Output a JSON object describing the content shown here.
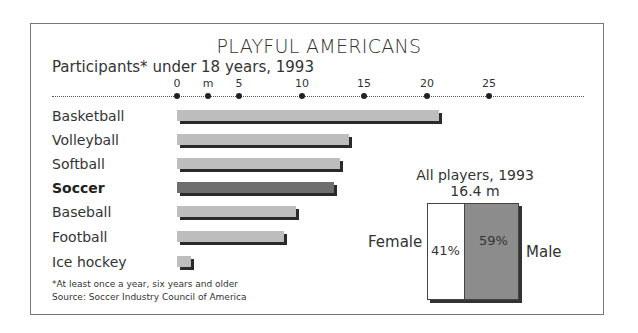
{
  "chart_data": [
    {
      "type": "bar",
      "orientation": "horizontal",
      "title": "PLAYFUL AMERICANS",
      "subtitle": "Participants* under 18 years, 1993",
      "xlabel": "m",
      "ylabel": "",
      "xlim": [
        0,
        25
      ],
      "x_ticks": [
        "0",
        "5",
        "10",
        "15",
        "20",
        "25"
      ],
      "unit_label": "m",
      "grid": false,
      "categories": [
        "Basketball",
        "Volleyball",
        "Softball",
        "Soccer",
        "Baseball",
        "Football",
        "Ice hockey"
      ],
      "values": [
        21.0,
        13.8,
        13.1,
        12.6,
        9.5,
        8.6,
        1.1
      ],
      "highlight": "Soccer",
      "colors": {
        "default": "#bdbdbd",
        "highlight": "#6e6e6e",
        "shadow": "#2a2a2a"
      }
    },
    {
      "type": "bar",
      "stacked": true,
      "title": "All players, 1993",
      "subtitle": "16.4 m",
      "categories": [
        "Female",
        "Male"
      ],
      "values": [
        41,
        59
      ],
      "value_labels": [
        "41%",
        "59%"
      ],
      "colors": {
        "Female": "#ffffff",
        "Male": "#8c8c8c"
      }
    }
  ],
  "header": {
    "title": "PLAYFUL AMERICANS",
    "subtitle": "Participants* under 18 years, 1993"
  },
  "axis": {
    "ticks": [
      {
        "label": "0",
        "x": 177
      },
      {
        "label": "5",
        "x": 239
      },
      {
        "label": "10",
        "x": 302
      },
      {
        "label": "15",
        "x": 364
      },
      {
        "label": "20",
        "x": 427
      },
      {
        "label": "25",
        "x": 489
      }
    ],
    "unit": {
      "label": "m",
      "x": 208
    }
  },
  "bars": [
    {
      "label": "Basketball",
      "value": 21.0,
      "top": 110
    },
    {
      "label": "Volleyball",
      "value": 13.8,
      "top": 134
    },
    {
      "label": "Softball",
      "value": 13.1,
      "top": 158
    },
    {
      "label": "Soccer",
      "value": 12.6,
      "top": 182
    },
    {
      "label": "Baseball",
      "value": 9.5,
      "top": 206
    },
    {
      "label": "Football",
      "value": 8.6,
      "top": 231
    },
    {
      "label": "Ice hockey",
      "value": 1.1,
      "top": 256
    }
  ],
  "inset": {
    "title": "All players, 1993",
    "total": "16.4 m",
    "female_label": "Female",
    "male_label": "Male",
    "female_pct": "41%",
    "male_pct": "59%"
  },
  "footer": {
    "note": "*At least once a year, six years and older",
    "source": "Source: Soccer Industry Council of America"
  }
}
